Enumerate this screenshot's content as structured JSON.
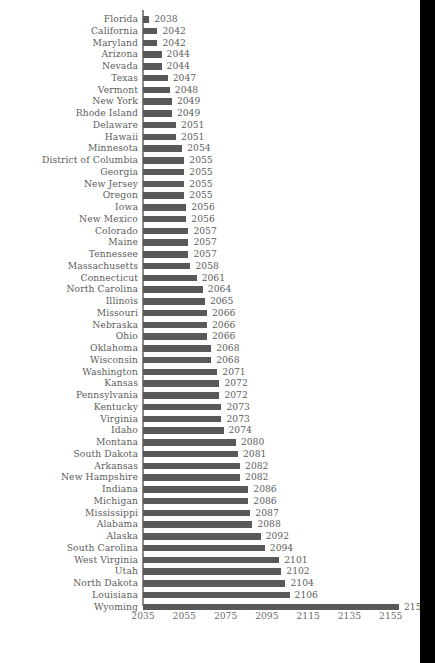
{
  "chart_data": {
    "type": "bar",
    "orientation": "horizontal",
    "title": "",
    "subtitle": "",
    "xlabel": "",
    "ylabel": "",
    "grid": false,
    "legend": null,
    "xlim": [
      2035,
      2159
    ],
    "xticks": [
      2035,
      2055,
      2075,
      2095,
      2115,
      2135,
      2155
    ],
    "bar_color": "#595959",
    "text_color": "#5d5d5d",
    "axis_color": "#8a8a8a",
    "value_labels_shown": true,
    "categories": [
      "Florida",
      "California",
      "Maryland",
      "Arizona",
      "Nevada",
      "Texas",
      "Vermont",
      "New York",
      "Rhode Island",
      "Delaware",
      "Hawaii",
      "Minnesota",
      "District of Columbia",
      "Georgia",
      "New Jersey",
      "Oregon",
      "Iowa",
      "New Mexico",
      "Colorado",
      "Maine",
      "Tennessee",
      "Massachusetts",
      "Connecticut",
      "North Carolina",
      "Illinois",
      "Missouri",
      "Nebraska",
      "Ohio",
      "Oklahoma",
      "Wisconsin",
      "Washington",
      "Kansas",
      "Pennsylvania",
      "Kentucky",
      "Virginia",
      "Idaho",
      "Montana",
      "South Dakota",
      "Arkansas",
      "New Hampshire",
      "Indiana",
      "Michigan",
      "Mississippi",
      "Alabama",
      "Alaska",
      "South Carolina",
      "West Virginia",
      "Utah",
      "North Dakota",
      "Louisiana",
      "Wyoming"
    ],
    "values": [
      2038,
      2042,
      2042,
      2044,
      2044,
      2047,
      2048,
      2049,
      2049,
      2051,
      2051,
      2054,
      2055,
      2055,
      2055,
      2055,
      2056,
      2056,
      2057,
      2057,
      2057,
      2058,
      2061,
      2064,
      2065,
      2066,
      2066,
      2066,
      2068,
      2068,
      2071,
      2072,
      2072,
      2073,
      2073,
      2074,
      2080,
      2081,
      2082,
      2082,
      2086,
      2086,
      2087,
      2088,
      2092,
      2094,
      2101,
      2102,
      2104,
      2106,
      2159
    ]
  }
}
